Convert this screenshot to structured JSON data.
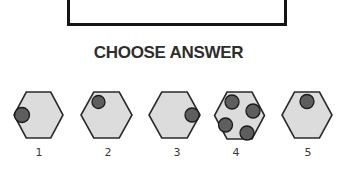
{
  "heading": "CHOOSE ANSWER",
  "colors": {
    "hexagon_fill": "#dcdcdc",
    "hexagon_stroke": "#2a2a2a",
    "dot_fill": "#5e5e5e",
    "dot_stroke": "#1a1a1a",
    "heading_text": "#2e2e2e",
    "box_border": "#141414"
  },
  "options": [
    {
      "label": "1",
      "hexagon": {
        "cx": 38.5,
        "cy": 115,
        "half_width": 24.5,
        "half_height": 23
      },
      "dots": [
        {
          "cx": 22,
          "cy": 115,
          "r": 7.5
        }
      ],
      "label_pos": {
        "x": 39,
        "y": 156
      }
    },
    {
      "label": "2",
      "hexagon": {
        "cx": 106.5,
        "cy": 115,
        "half_width": 25.5,
        "half_height": 23
      },
      "dots": [
        {
          "cx": 98.5,
          "cy": 102,
          "r": 6.5
        }
      ],
      "label_pos": {
        "x": 108,
        "y": 156
      }
    },
    {
      "label": "3",
      "hexagon": {
        "cx": 174.5,
        "cy": 115,
        "half_width": 25.5,
        "half_height": 23
      },
      "dots": [
        {
          "cx": 192,
          "cy": 115,
          "r": 7
        }
      ],
      "label_pos": {
        "x": 177,
        "y": 156
      }
    },
    {
      "label": "4",
      "hexagon": {
        "cx": 239.5,
        "cy": 115.5,
        "half_width": 25,
        "half_height": 23.5
      },
      "dots": [
        {
          "cx": 232,
          "cy": 102,
          "r": 7
        },
        {
          "cx": 253,
          "cy": 111,
          "r": 7
        },
        {
          "cx": 225.5,
          "cy": 125,
          "r": 7
        },
        {
          "cx": 247,
          "cy": 133,
          "r": 7
        }
      ],
      "label_pos": {
        "x": 236,
        "y": 156
      }
    },
    {
      "label": "5",
      "hexagon": {
        "cx": 307,
        "cy": 115,
        "half_width": 25,
        "half_height": 23
      },
      "dots": [
        {
          "cx": 307,
          "cy": 101.5,
          "r": 7
        }
      ],
      "label_pos": {
        "x": 308,
        "y": 156
      }
    }
  ]
}
